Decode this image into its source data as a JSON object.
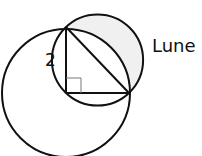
{
  "diagram": {
    "type": "geometry",
    "labels": {
      "side_length": "2",
      "region": "Lune"
    },
    "colors": {
      "stroke": "#111111",
      "lune_fill": "#f0f0f0",
      "right_angle_marker": "#777777"
    },
    "shapes": {
      "large_circle": {
        "cx": 66,
        "cy": 93,
        "r": 64
      },
      "small_circle": {
        "cx": 97.5,
        "cy": 60,
        "r": 45.6
      },
      "triangle": [
        [
          66,
          27
        ],
        [
          66,
          93
        ],
        [
          129,
          93
        ]
      ],
      "right_angle_at": [
        66,
        93
      ]
    }
  }
}
